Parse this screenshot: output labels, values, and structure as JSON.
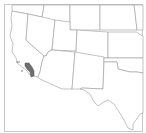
{
  "map": {
    "region": "Southwestern United States",
    "highlighted_area": "Southern California coastal county (Los Angeles area)",
    "colors": {
      "background": "#ffffff",
      "state_fill": "#ffffff",
      "state_border": "#9a9a9a",
      "highlight_fill": "#6e6e6e",
      "frame": "#c8c8c8"
    },
    "visible_states": [
      "California",
      "Oregon",
      "Idaho",
      "Nevada",
      "Utah",
      "Wyoming",
      "Colorado",
      "Arizona",
      "New Mexico",
      "Texas",
      "Oklahoma",
      "Kansas",
      "Nebraska",
      "South Dakota"
    ]
  }
}
